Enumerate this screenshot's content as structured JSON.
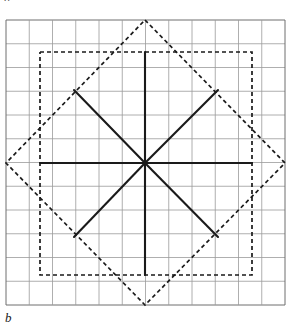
{
  "figure": {
    "label_top": "a",
    "label_bottom": "b",
    "canvas": {
      "width": 289,
      "height": 329
    },
    "colors": {
      "grid_line": "#9a9a9a",
      "grid_border": "#6e6e6e",
      "solid_stroke": "#1a1a1a",
      "dashed_stroke": "#1a1a1a",
      "background": "#ffffff"
    },
    "grid": {
      "x0": 6,
      "y0": 20,
      "columns": 12,
      "rows": 12,
      "cell_width": 23.25,
      "cell_height": 23.75,
      "line_width": 0.8,
      "visible": true
    },
    "center": {
      "x": 145,
      "y": 163
    },
    "solid_star": {
      "stroke_width": 2.1,
      "style": "solid",
      "arms": [
        {
          "name": "arm-up",
          "x1": 145,
          "y1": 163,
          "x2": 145,
          "y2": 52
        },
        {
          "name": "arm-down",
          "x1": 145,
          "y1": 163,
          "x2": 145,
          "y2": 275
        },
        {
          "name": "arm-left",
          "x1": 145,
          "y1": 163,
          "x2": 40,
          "y2": 163
        },
        {
          "name": "arm-right",
          "x1": 145,
          "y1": 163,
          "x2": 252,
          "y2": 163
        },
        {
          "name": "arm-up-left",
          "x1": 145,
          "y1": 163,
          "x2": 74,
          "y2": 90
        },
        {
          "name": "arm-up-right",
          "x1": 145,
          "y1": 163,
          "x2": 218,
          "y2": 90
        },
        {
          "name": "arm-down-left",
          "x1": 145,
          "y1": 163,
          "x2": 74,
          "y2": 237
        },
        {
          "name": "arm-down-right",
          "x1": 145,
          "y1": 163,
          "x2": 218,
          "y2": 237
        }
      ]
    },
    "dashed_square": {
      "style": "dashed",
      "stroke_width": 1.7,
      "dash_pattern": "4 3",
      "points": "40,52 252,52 252,275 40,275 40,52",
      "corners": [
        {
          "x": 40,
          "y": 52
        },
        {
          "x": 252,
          "y": 52
        },
        {
          "x": 252,
          "y": 275
        },
        {
          "x": 40,
          "y": 275
        }
      ]
    },
    "dashed_diamond": {
      "style": "dashed",
      "stroke_width": 1.7,
      "dash_pattern": "4 3",
      "points": "145,20 285,163 145,305 6,163 145,20",
      "corners": [
        {
          "x": 145,
          "y": 20
        },
        {
          "x": 285,
          "y": 163
        },
        {
          "x": 145,
          "y": 305
        },
        {
          "x": 6,
          "y": 163
        }
      ]
    }
  }
}
